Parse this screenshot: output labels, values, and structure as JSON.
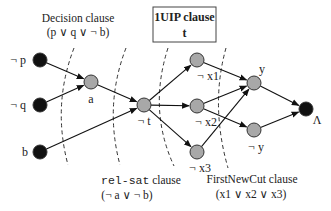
{
  "title_box": {
    "line1": "1UIP clause",
    "line2": "t"
  },
  "clauses": {
    "decision": {
      "name": "Decision clause",
      "formula": "(p ∨ q ∨ ¬ b)"
    },
    "relsat": {
      "name_mono": "rel-sat",
      "name_rest": " clause",
      "formula": "(¬ a ∨ ¬ b)"
    },
    "firstnewcut": {
      "name": "FirstNewCut clause",
      "formula": "(x1 ∨ x2 ∨ x3)"
    }
  },
  "nodes": [
    {
      "id": "np",
      "label": "¬ p",
      "x": 40,
      "y": 60,
      "fill": "#111111",
      "lx": 26,
      "ly": 64,
      "anchor": "end"
    },
    {
      "id": "nq",
      "label": "¬ q",
      "x": 40,
      "y": 105,
      "fill": "#111111",
      "lx": 26,
      "ly": 109,
      "anchor": "end"
    },
    {
      "id": "b",
      "label": "b",
      "x": 40,
      "y": 152,
      "fill": "#111111",
      "lx": 28,
      "ly": 156,
      "anchor": "end"
    },
    {
      "id": "a",
      "label": "a",
      "x": 91,
      "y": 82,
      "fill": "#a8a8a8",
      "lx": 91,
      "ly": 103,
      "anchor": "middle"
    },
    {
      "id": "nt",
      "label": "¬ t",
      "x": 144,
      "y": 105,
      "fill": "#a8a8a8",
      "lx": 144,
      "ly": 125,
      "anchor": "middle"
    },
    {
      "id": "nx1",
      "label": "¬ x1",
      "x": 197,
      "y": 60,
      "fill": "#a8a8a8",
      "lx": 208,
      "ly": 80,
      "anchor": "middle"
    },
    {
      "id": "nx2",
      "label": "¬ x2",
      "x": 197,
      "y": 106,
      "fill": "#a8a8a8",
      "lx": 206,
      "ly": 126,
      "anchor": "middle"
    },
    {
      "id": "nx3",
      "label": "¬ x3",
      "x": 197,
      "y": 152,
      "fill": "#a8a8a8",
      "lx": 200,
      "ly": 172,
      "anchor": "middle"
    },
    {
      "id": "y",
      "label": "y",
      "x": 254,
      "y": 83,
      "fill": "#a8a8a8",
      "lx": 262,
      "ly": 73,
      "anchor": "middle"
    },
    {
      "id": "ny",
      "label": "¬ y",
      "x": 254,
      "y": 130,
      "fill": "#a8a8a8",
      "lx": 256,
      "ly": 151,
      "anchor": "middle"
    },
    {
      "id": "lambda",
      "label": "Λ",
      "x": 306,
      "y": 109,
      "fill": "#111111",
      "lx": 317,
      "ly": 124,
      "anchor": "middle"
    }
  ],
  "edges": [
    {
      "from": "np",
      "to": "a"
    },
    {
      "from": "nq",
      "to": "a"
    },
    {
      "from": "a",
      "to": "nt"
    },
    {
      "from": "b",
      "to": "nt"
    },
    {
      "from": "nt",
      "to": "nx1"
    },
    {
      "from": "nt",
      "to": "nx2"
    },
    {
      "from": "nt",
      "to": "nx3"
    },
    {
      "from": "nx1",
      "to": "y"
    },
    {
      "from": "nx2",
      "to": "y"
    },
    {
      "from": "nx3",
      "to": "y"
    },
    {
      "from": "nx2",
      "to": "ny"
    },
    {
      "from": "y",
      "to": "lambda"
    },
    {
      "from": "ny",
      "to": "lambda"
    }
  ],
  "cuts": [
    {
      "name": "decision-cut",
      "path": "M 74 48 Q 52 105 68 165"
    },
    {
      "name": "relsat-cut",
      "path": "M 126 48 Q 104 105 120 165"
    },
    {
      "name": "uip-cut",
      "path": "M 168 48 Q 148 110 174 166"
    },
    {
      "name": "firstnewcut-cut",
      "path": "M 226 48 Q 210 105 228 168"
    }
  ]
}
